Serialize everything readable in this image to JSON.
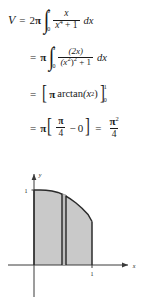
{
  "document": {
    "type": "calculus-worked-solution",
    "topic": "volume-by-cylindrical-shells"
  },
  "solution": {
    "lines": [
      {
        "id": "line-1",
        "lhs": "V",
        "relation": "=",
        "coefficient": "2",
        "pi": "π",
        "integral": {
          "lower": "0",
          "upper": "1"
        },
        "numerator": "x",
        "denominator_base": "x",
        "denominator_exp": "4",
        "denominator_tail": " + 1",
        "differential": "dx"
      },
      {
        "id": "line-2",
        "relation": "=",
        "pi": "π",
        "integral": {
          "lower": "0",
          "upper": "1"
        },
        "numerator": "(2x)",
        "denominator_base": "(x",
        "denominator_exp": "2",
        "denominator_mid": ")",
        "denominator_exp2": "2",
        "denominator_tail": " + 1",
        "differential": "dx"
      },
      {
        "id": "line-3",
        "relation": "=",
        "bracket_left": "[",
        "pi": "π",
        "function": "arctan",
        "argument_base": "(x",
        "argument_exp": "2",
        "argument_tail": ")",
        "bracket_right": "]",
        "eval_upper": "1",
        "eval_lower": "0"
      },
      {
        "id": "line-4",
        "relation": "=",
        "pi": "π",
        "bracket_left": "[",
        "frac_num": "π",
        "frac_den": "4",
        "minus": "−",
        "zero": "0",
        "bracket_right": "]",
        "relation2": "=",
        "result_num": "π",
        "result_num_exp": "2",
        "result_den": "4"
      }
    ]
  },
  "figure": {
    "name": "shaded-region-with-cylindrical-shell",
    "axes": {
      "x_label": "x",
      "y_label": "y",
      "x_tick_label": "1",
      "y_tick_label": "1"
    },
    "colors": {
      "shade_fill": "#c9c9c9",
      "curve_stroke": "#2b2b2b",
      "axis_stroke": "#3a3a3a",
      "shell_stroke": "#1a1a1a",
      "background": "#ffffff"
    },
    "curve": {
      "description": "decreasing curve from (0,1) to (1,0.5)",
      "points": [
        [
          0.0,
          1.0
        ],
        [
          0.1,
          1.0
        ],
        [
          0.2,
          0.995
        ],
        [
          0.3,
          0.985
        ],
        [
          0.4,
          0.96
        ],
        [
          0.5,
          0.92
        ],
        [
          0.6,
          0.86
        ],
        [
          0.7,
          0.79
        ],
        [
          0.8,
          0.71
        ],
        [
          0.9,
          0.61
        ],
        [
          1.0,
          0.5
        ]
      ]
    },
    "shell": {
      "x_position": 0.55,
      "width": 0.045
    }
  }
}
